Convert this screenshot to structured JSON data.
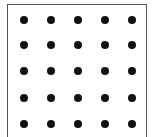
{
  "diagram": {
    "type": "dot-grid",
    "rows": 5,
    "cols": 5,
    "col_x": [
      24,
      51,
      78,
      105,
      132
    ],
    "row_y": [
      20,
      45,
      71,
      98,
      124
    ],
    "dot_color": "#111111",
    "border_color": "#555555"
  }
}
